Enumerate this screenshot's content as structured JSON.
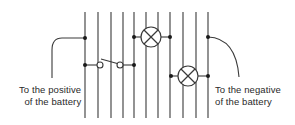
{
  "diagram": {
    "type": "circuit",
    "colors": {
      "line": "#3a3a3a",
      "background": "#ffffff"
    },
    "vertical_lines_x": [
      85,
      98,
      111,
      123,
      134,
      146,
      158,
      170,
      183,
      196,
      208
    ],
    "line_top_y": 12,
    "line_bottom_y": 118,
    "components": [
      {
        "type": "lamp",
        "cx": 151,
        "cy": 37,
        "r": 10
      },
      {
        "type": "lamp",
        "cx": 188,
        "cy": 76,
        "r": 10
      },
      {
        "type": "switch",
        "state": "open"
      }
    ],
    "labels": {
      "positive": {
        "line1": "To the positive",
        "line2": "of the battery"
      },
      "negative": {
        "line1": "To the negative",
        "line2": "of the battery"
      }
    }
  }
}
